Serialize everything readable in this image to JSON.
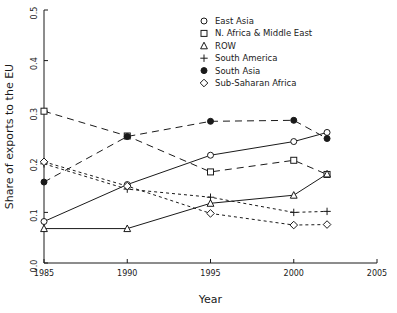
{
  "chart_data": {
    "type": "line",
    "title": "",
    "xlabel": "Year",
    "ylabel": "Share of exports to the EU",
    "x": [
      1985,
      1990,
      1995,
      2000,
      2002
    ],
    "xlim": [
      1985,
      2005
    ],
    "ylim": [
      0.0,
      0.5
    ],
    "xticks": [
      1985,
      1990,
      1995,
      2000,
      2005
    ],
    "xtick_labels": [
      "1985",
      "1990",
      "1995",
      "2000",
      "2005"
    ],
    "yticks": [
      0.0,
      0.1,
      0.2,
      0.3,
      0.4,
      0.5
    ],
    "ytick_labels": [
      "0.0",
      "0.1",
      "0.2",
      "0.3",
      "0.4",
      "0.5"
    ],
    "grid": false,
    "legend_position": "top-center-right",
    "series": [
      {
        "name": "East Asia",
        "marker": "open-circle",
        "linestyle": "solid",
        "color": "#1a1a1a",
        "values": [
          0.082,
          0.155,
          0.213,
          0.24,
          0.258
        ]
      },
      {
        "name": "N. Africa & Middle East",
        "marker": "open-square",
        "linestyle": "dashed",
        "color": "#1a1a1a",
        "values": [
          0.3,
          0.251,
          0.18,
          0.203,
          0.175
        ]
      },
      {
        "name": "ROW",
        "marker": "open-triangle",
        "linestyle": "solid",
        "color": "#1a1a1a",
        "values": [
          0.068,
          0.068,
          0.118,
          0.134,
          0.176
        ]
      },
      {
        "name": "South America",
        "marker": "plus",
        "linestyle": "dotted",
        "color": "#1a1a1a",
        "values": [
          0.196,
          0.146,
          0.13,
          0.1,
          0.102
        ]
      },
      {
        "name": "South Asia",
        "marker": "filled-circle",
        "linestyle": "dashed",
        "color": "#1a1a1a",
        "values": [
          0.16,
          0.25,
          0.28,
          0.282,
          0.246
        ]
      },
      {
        "name": "Sub-Saharan Africa",
        "marker": "open-diamond",
        "linestyle": "dotted",
        "color": "#1a1a1a",
        "values": [
          0.2,
          0.152,
          0.098,
          0.075,
          0.076
        ]
      }
    ]
  },
  "legend": {
    "entries": [
      {
        "label": "East Asia",
        "marker": "open-circle"
      },
      {
        "label": "N. Africa & Middle East",
        "marker": "open-square"
      },
      {
        "label": "ROW",
        "marker": "open-triangle"
      },
      {
        "label": "South America",
        "marker": "plus"
      },
      {
        "label": "South Asia",
        "marker": "filled-circle"
      },
      {
        "label": "Sub-Saharan Africa",
        "marker": "open-diamond"
      }
    ]
  },
  "colors": {
    "axis": "#1a1a1a",
    "background": "#ffffff",
    "ink": "#1a1a1a"
  }
}
